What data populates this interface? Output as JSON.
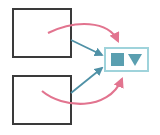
{
  "diagram": {
    "background_color": "#ffffff",
    "width": 160,
    "height": 135,
    "colors": {
      "box_border": "#3a3a3a",
      "panel_border": "#9fd3db",
      "teal_arrow": "#4f91a6",
      "teal_glyph": "#5a9fb0",
      "pink_arrow": "#e2748f",
      "background": "#ffffff"
    },
    "source_boxes": [
      {
        "name": "top-source-box",
        "label": "",
        "x": 12,
        "y": 8,
        "width": 60,
        "height": 50,
        "border_width": 2
      },
      {
        "name": "bottom-source-box",
        "label": "",
        "x": 12,
        "y": 75,
        "width": 60,
        "height": 50,
        "border_width": 2
      }
    ],
    "target_panel": {
      "name": "icon-panel",
      "label": "",
      "x": 104,
      "y": 47,
      "width": 45,
      "height": 25,
      "border_width": 2,
      "glyphs": [
        {
          "name": "square-glyph",
          "shape": "square"
        },
        {
          "name": "triangle-down-glyph",
          "shape": "triangle-down"
        }
      ]
    },
    "connectors": [
      {
        "name": "teal-arrow-from-top-box",
        "style": "straight",
        "color": "#4f91a6",
        "path": "M 71 40 L 102 55",
        "arrowhead": "end"
      },
      {
        "name": "teal-arrow-from-bottom-box",
        "style": "straight",
        "color": "#4f91a6",
        "path": "M 71 93 L 102 68",
        "arrowhead": "end"
      },
      {
        "name": "pink-curve-from-top-box",
        "style": "curved",
        "color": "#e2748f",
        "path": "M 48 33 C 75 20, 108 20, 118 41",
        "arrowhead": "end"
      },
      {
        "name": "pink-curve-from-bottom-box",
        "style": "curved",
        "color": "#e2748f",
        "path": "M 42 91 C 62 108, 108 112, 122 79",
        "arrowhead": "end"
      }
    ]
  }
}
